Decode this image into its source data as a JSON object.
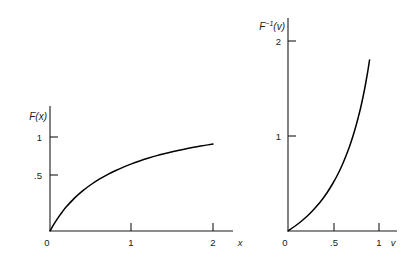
{
  "figure": {
    "background_color": "#ffffff",
    "ink_color": "#1a1a1a",
    "curve_color": "#000000"
  },
  "chart_data": [
    {
      "type": "line",
      "title": "",
      "subtitle": "",
      "panel": "left",
      "ylabel": "F(x)",
      "xlabel": "x",
      "xlim": [
        0,
        2.35
      ],
      "ylim": [
        0,
        1.12
      ],
      "grid": false,
      "legend": null,
      "xticks": [
        0,
        1,
        2
      ],
      "xticklabels": [
        "0",
        "1",
        "2"
      ],
      "yticks": [
        0.5,
        1
      ],
      "yticklabels": [
        ".5",
        "1"
      ],
      "series": [
        {
          "name": "F(x)",
          "shape": "concave-increasing",
          "x": [
            0.0,
            0.05,
            0.1,
            0.15,
            0.2,
            0.3,
            0.4,
            0.5,
            0.6,
            0.7,
            0.8,
            0.9,
            1.0,
            1.1,
            1.2,
            1.3,
            1.4,
            1.5,
            1.6,
            1.7,
            1.8,
            1.9,
            2.0
          ],
          "y": [
            0.0,
            0.075,
            0.143,
            0.203,
            0.257,
            0.35,
            0.427,
            0.492,
            0.549,
            0.598,
            0.641,
            0.68,
            0.714,
            0.745,
            0.773,
            0.799,
            0.822,
            0.843,
            0.862,
            0.88,
            0.896,
            0.911,
            0.925
          ]
        }
      ]
    },
    {
      "type": "line",
      "title": "",
      "subtitle": "",
      "panel": "right",
      "ylabel": "F−1(v)",
      "ylabel_base": "F",
      "ylabel_exponent": "−1",
      "ylabel_arg": "(v)",
      "xlabel": "v",
      "xlim": [
        0,
        1.18
      ],
      "ylim": [
        0,
        2.22
      ],
      "grid": false,
      "legend": null,
      "xticks": [
        0,
        0.5,
        1
      ],
      "xticklabels": [
        "0",
        ".5",
        "1"
      ],
      "yticks": [
        1,
        2
      ],
      "yticklabels": [
        "1",
        "2"
      ],
      "series": [
        {
          "name": "F inverse of v",
          "shape": "convex-increasing",
          "x": [
            0.0,
            0.075,
            0.143,
            0.203,
            0.257,
            0.35,
            0.427,
            0.492,
            0.549,
            0.598,
            0.641,
            0.68,
            0.714,
            0.745,
            0.773,
            0.799,
            0.822,
            0.843,
            0.862,
            0.88,
            0.896
          ],
          "y": [
            0.0,
            0.05,
            0.1,
            0.15,
            0.2,
            0.3,
            0.4,
            0.5,
            0.6,
            0.7,
            0.8,
            0.9,
            1.0,
            1.1,
            1.2,
            1.3,
            1.4,
            1.5,
            1.6,
            1.7,
            1.8
          ]
        }
      ]
    }
  ]
}
